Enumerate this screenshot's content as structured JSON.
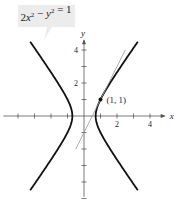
{
  "chart_data": {
    "type": "line",
    "title": "",
    "equation_label": "2x² − y² = 1",
    "xlabel": "x",
    "ylabel": "y",
    "xlim": [
      -5,
      5
    ],
    "ylim": [
      -5,
      5
    ],
    "x_ticks": [
      -4,
      -3,
      -2,
      -1,
      1,
      2,
      3,
      4
    ],
    "x_tick_labels": [
      {
        "value": 2,
        "label": "2"
      },
      {
        "value": 4,
        "label": "4"
      }
    ],
    "y_ticks": [
      -5,
      -4,
      -3,
      -2,
      -1,
      1,
      2,
      3,
      4
    ],
    "y_tick_labels": [
      {
        "value": 2,
        "label": "2"
      },
      {
        "value": 4,
        "label": "4"
      }
    ],
    "grid": false,
    "series": [
      {
        "name": "hyperbola-right-branch",
        "equation": "2x^2 - y^2 = 1",
        "branch": "right",
        "y_range": [
          -4.5,
          4.5
        ],
        "color": "#111111"
      },
      {
        "name": "hyperbola-left-branch",
        "equation": "2x^2 - y^2 = 1",
        "branch": "left",
        "y_range": [
          -4.5,
          4.5
        ],
        "color": "#111111"
      },
      {
        "name": "tangent-line",
        "equation": "y = 2x - 1",
        "x_range": [
          -0.5,
          2.5
        ],
        "color": "#999999"
      }
    ],
    "points": [
      {
        "x": 1,
        "y": 1,
        "label": "(1, 1)"
      }
    ]
  }
}
